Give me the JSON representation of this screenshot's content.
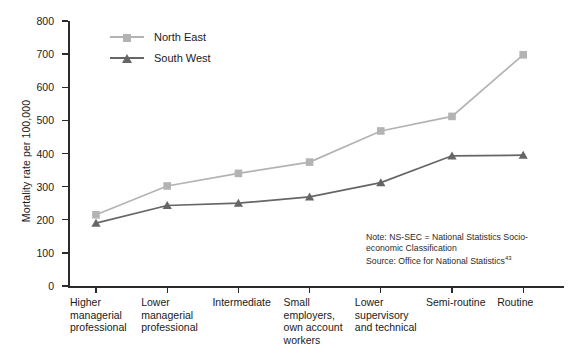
{
  "chart_data": {
    "type": "line",
    "title": "",
    "xlabel": "",
    "ylabel": "Mortality rate per 100,000",
    "ylim": [
      0,
      800
    ],
    "ytick_values": [
      0,
      100,
      200,
      300,
      400,
      500,
      600,
      700,
      800
    ],
    "ytick_labels": [
      "0",
      "100",
      "200",
      "300",
      "400",
      "500",
      "600",
      "700",
      "800"
    ],
    "grid": false,
    "legend_position": "top-left-inside",
    "categories": [
      "Higher\nmanagerial\nprofessional",
      "Lower\nmanagerial\nprofessional",
      "Intermediate",
      "Small\nemployers,\nown account\nworkers",
      "Lower\nsupervisory\nand technical",
      "Semi-routine",
      "Routine"
    ],
    "series": [
      {
        "name": "North East",
        "color": "#b3b3b3",
        "marker": "square",
        "values": [
          215,
          302,
          340,
          374,
          468,
          512,
          698
        ]
      },
      {
        "name": "South West",
        "color": "#666666",
        "marker": "triangle",
        "values": [
          190,
          243,
          250,
          269,
          312,
          393,
          395
        ]
      }
    ],
    "annotations": [
      "Note: NS-SEC = National Statistics Socio-economic Classification",
      "Source: Office for National Statistics"
    ]
  },
  "note": {
    "line1": "Note: NS-SEC = National Statistics Socio-",
    "line2": "economic Classification",
    "line3": "Source: Office for National Statistics",
    "superscript": "43"
  },
  "axis": {
    "y_title": "Mortality rate per 100,000"
  },
  "colors": {
    "north_east": "#b3b3b3",
    "south_west": "#666666",
    "axis": "#2b2b2b",
    "text": "#1a1a1a",
    "background": "#ffffff"
  }
}
